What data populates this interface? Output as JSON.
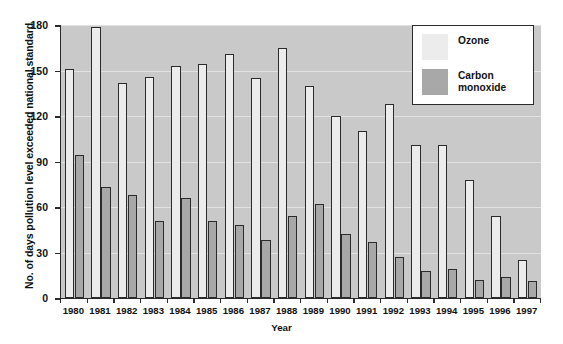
{
  "chart_data": {
    "type": "bar",
    "title": "",
    "xlabel": "Year",
    "ylabel": "No. of days pollution level exceeded national standard",
    "ylim": [
      0,
      180
    ],
    "ytick_values": [
      0,
      30,
      60,
      90,
      120,
      150,
      180
    ],
    "ytick_labels": [
      "0",
      "30",
      "60",
      "90",
      "120",
      "150",
      "180"
    ],
    "grid": true,
    "legend_position": "top-right",
    "categories": [
      "1980",
      "1981",
      "1982",
      "1983",
      "1984",
      "1985",
      "1986",
      "1987",
      "1988",
      "1989",
      "1990",
      "1991",
      "1992",
      "1993",
      "1994",
      "1995",
      "1996",
      "1997"
    ],
    "series": [
      {
        "name": "Ozone",
        "color": "#ececec",
        "values": [
          151,
          179,
          142,
          146,
          153,
          154,
          161,
          145,
          165,
          140,
          120,
          110,
          128,
          101,
          101,
          78,
          54,
          25
        ]
      },
      {
        "name": "Carbon monoxide",
        "color": "#a8a8a8",
        "values": [
          94,
          73,
          68,
          51,
          66,
          51,
          48,
          38,
          54,
          62,
          42,
          37,
          27,
          18,
          19,
          12,
          14,
          11
        ]
      }
    ]
  },
  "legend": {
    "entries": [
      {
        "label": "Ozone",
        "color": "#ececec"
      },
      {
        "label": "Carbon monoxide",
        "color": "#a8a8a8"
      }
    ]
  },
  "colors": {
    "plot_background": "#c9c9c9",
    "page_background": "#ffffff",
    "axis": "#2b2b2b",
    "gridline": "#e2e2e2",
    "ozone": "#ececec",
    "carbon_monoxide": "#a8a8a8"
  }
}
